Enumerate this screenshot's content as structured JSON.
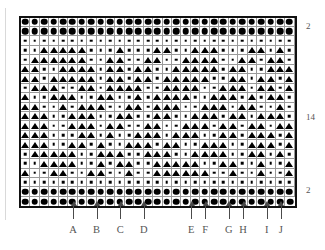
{
  "chart_data": {
    "type": "heatmap",
    "title": "",
    "xlabel": "",
    "ylabel": "",
    "columns": 29,
    "rows": 18,
    "symbol_legend": {
      "big": "large-filled-circle",
      "dot": "small-filled-dot",
      "tri": "filled-triangle",
      "empty": "blank-cell"
    },
    "row_groups": [
      {
        "label": "2",
        "count": 2,
        "type": "border-top"
      },
      {
        "label": "14",
        "count": 14,
        "type": "pattern"
      },
      {
        "label": "2",
        "count": 2,
        "type": "border-bottom"
      }
    ],
    "matrix": [
      [
        "big",
        "big",
        "big",
        "big",
        "big",
        "big",
        "big",
        "big",
        "big",
        "big",
        "big",
        "big",
        "big",
        "big",
        "big",
        "big",
        "big",
        "big",
        "big",
        "big",
        "big",
        "big",
        "big",
        "big",
        "big",
        "big",
        "big",
        "big",
        "big"
      ],
      [
        "big",
        "big",
        "big",
        "big",
        "big",
        "big",
        "big",
        "big",
        "big",
        "big",
        "big",
        "big",
        "big",
        "big",
        "big",
        "big",
        "big",
        "big",
        "big",
        "big",
        "big",
        "big",
        "big",
        "big",
        "big",
        "big",
        "big",
        "big",
        "big"
      ],
      [
        "dot",
        "dot",
        "dot",
        "dot",
        "dot",
        "dot",
        "dot",
        "dot",
        "dot",
        "dot",
        "dot",
        "dot",
        "dot",
        "dot",
        "dot",
        "dot",
        "dot",
        "dot",
        "dot",
        "dot",
        "dot",
        "dot",
        "dot",
        "dot",
        "dot",
        "dot",
        "dot",
        "dot",
        "dot"
      ],
      [
        "dot",
        "dot",
        "tri",
        "tri",
        "tri",
        "tri",
        "tri",
        "dot",
        "dot",
        "dot",
        "tri",
        "dot",
        "dot",
        "dot",
        "tri",
        "tri",
        "dot",
        "dot",
        "tri",
        "tri",
        "tri",
        "dot",
        "dot",
        "dot",
        "tri",
        "tri",
        "dot",
        "tri",
        "dot"
      ],
      [
        "dot",
        "tri",
        "tri",
        "tri",
        "tri",
        "tri",
        "tri",
        "dot",
        "dot",
        "tri",
        "tri",
        "dot",
        "dot",
        "tri",
        "tri",
        "dot",
        "dot",
        "tri",
        "tri",
        "tri",
        "tri",
        "dot",
        "dot",
        "tri",
        "tri",
        "dot",
        "tri",
        "tri",
        "dot"
      ],
      [
        "tri",
        "tri",
        "dot",
        "dot",
        "tri",
        "tri",
        "tri",
        "tri",
        "dot",
        "tri",
        "tri",
        "dot",
        "tri",
        "tri",
        "dot",
        "dot",
        "tri",
        "tri",
        "tri",
        "tri",
        "tri",
        "dot",
        "tri",
        "tri",
        "dot",
        "dot",
        "tri",
        "tri",
        "tri"
      ],
      [
        "tri",
        "tri",
        "dot",
        "tri",
        "tri",
        "tri",
        "tri",
        "tri",
        "dot",
        "tri",
        "tri",
        "dot",
        "tri",
        "tri",
        "dot",
        "tri",
        "tri",
        "tri",
        "tri",
        "tri",
        "dot",
        "dot",
        "tri",
        "tri",
        "dot",
        "tri",
        "tri",
        "dot",
        "tri"
      ],
      [
        "dot",
        "tri",
        "tri",
        "tri",
        "dot",
        "dot",
        "tri",
        "tri",
        "dot",
        "tri",
        "tri",
        "tri",
        "tri",
        "dot",
        "dot",
        "tri",
        "tri",
        "tri",
        "tri",
        "dot",
        "dot",
        "tri",
        "tri",
        "tri",
        "dot",
        "tri",
        "tri",
        "dot",
        "tri"
      ],
      [
        "tri",
        "dot",
        "dot",
        "tri",
        "tri",
        "tri",
        "dot",
        "dot",
        "tri",
        "tri",
        "dot",
        "dot",
        "tri",
        "dot",
        "tri",
        "tri",
        "tri",
        "tri",
        "dot",
        "dot",
        "tri",
        "tri",
        "tri",
        "dot",
        "tri",
        "dot",
        "tri",
        "tri",
        "dot"
      ],
      [
        "tri",
        "tri",
        "dot",
        "dot",
        "tri",
        "dot",
        "tri",
        "tri",
        "tri",
        "dot",
        "dot",
        "tri",
        "tri",
        "dot",
        "tri",
        "tri",
        "tri",
        "dot",
        "dot",
        "tri",
        "tri",
        "tri",
        "dot",
        "tri",
        "tri",
        "dot",
        "dot",
        "tri",
        "dot"
      ],
      [
        "tri",
        "tri",
        "tri",
        "dot",
        "dot",
        "tri",
        "tri",
        "tri",
        "dot",
        "dot",
        "tri",
        "tri",
        "dot",
        "dot",
        "tri",
        "tri",
        "dot",
        "dot",
        "tri",
        "tri",
        "tri",
        "dot",
        "tri",
        "tri",
        "dot",
        "tri",
        "tri",
        "tri",
        "dot"
      ],
      [
        "tri",
        "tri",
        "tri",
        "dot",
        "dot",
        "tri",
        "tri",
        "tri",
        "dot",
        "tri",
        "tri",
        "dot",
        "dot",
        "tri",
        "tri",
        "dot",
        "dot",
        "tri",
        "tri",
        "tri",
        "dot",
        "tri",
        "tri",
        "dot",
        "tri",
        "tri",
        "dot",
        "tri",
        "tri"
      ],
      [
        "tri",
        "tri",
        "tri",
        "dot",
        "dot",
        "dot",
        "tri",
        "tri",
        "dot",
        "tri",
        "dot",
        "dot",
        "tri",
        "tri",
        "tri",
        "dot",
        "tri",
        "tri",
        "tri",
        "dot",
        "dot",
        "tri",
        "tri",
        "dot",
        "tri",
        "tri",
        "tri",
        "dot",
        "tri"
      ],
      [
        "tri",
        "tri",
        "tri",
        "dot",
        "dot",
        "tri",
        "tri",
        "dot",
        "tri",
        "dot",
        "dot",
        "tri",
        "tri",
        "tri",
        "dot",
        "tri",
        "tri",
        "dot",
        "dot",
        "tri",
        "tri",
        "tri",
        "dot",
        "dot",
        "tri",
        "tri",
        "tri",
        "dot",
        "tri"
      ],
      [
        "dot",
        "tri",
        "tri",
        "tri",
        "tri",
        "tri",
        "dot",
        "dot",
        "tri",
        "tri",
        "tri",
        "dot",
        "dot",
        "tri",
        "tri",
        "tri",
        "dot",
        "dot",
        "tri",
        "tri",
        "tri",
        "tri",
        "dot",
        "dot",
        "tri",
        "tri",
        "dot",
        "tri",
        "dot"
      ],
      [
        "dot",
        "dot",
        "tri",
        "tri",
        "tri",
        "tri",
        "dot",
        "dot",
        "tri",
        "dot",
        "tri",
        "tri",
        "dot",
        "dot",
        "tri",
        "tri",
        "tri",
        "tri",
        "tri",
        "dot",
        "dot",
        "tri",
        "tri",
        "dot",
        "dot",
        "tri",
        "dot",
        "dot",
        "tri"
      ],
      [
        "tri",
        "dot",
        "dot",
        "tri",
        "tri",
        "dot",
        "dot",
        "tri",
        "tri",
        "dot",
        "dot",
        "tri",
        "dot",
        "dot",
        "tri",
        "tri",
        "tri",
        "tri",
        "tri",
        "tri",
        "dot",
        "dot",
        "tri",
        "dot",
        "dot",
        "tri",
        "dot",
        "dot",
        "tri"
      ],
      [
        "dot",
        "dot",
        "dot",
        "dot",
        "dot",
        "dot",
        "dot",
        "dot",
        "dot",
        "dot",
        "dot",
        "dot",
        "dot",
        "dot",
        "dot",
        "dot",
        "dot",
        "dot",
        "dot",
        "dot",
        "dot",
        "dot",
        "dot",
        "dot",
        "dot",
        "dot",
        "dot",
        "dot",
        "dot"
      ],
      [
        "big",
        "big",
        "big",
        "big",
        "big",
        "big",
        "big",
        "big",
        "big",
        "big",
        "big",
        "big",
        "big",
        "big",
        "big",
        "big",
        "big",
        "big",
        "big",
        "big",
        "big",
        "big",
        "big",
        "big",
        "big",
        "big",
        "big",
        "big",
        "big"
      ],
      [
        "big",
        "big",
        "big",
        "big",
        "big",
        "big",
        "big",
        "big",
        "big",
        "big",
        "big",
        "big",
        "big",
        "big",
        "big",
        "big",
        "big",
        "big",
        "big",
        "big",
        "big",
        "big",
        "big",
        "big",
        "big",
        "big",
        "big",
        "big",
        "big"
      ]
    ]
  },
  "right_labels": [
    {
      "text": "2",
      "top": 22
    },
    {
      "text": "14",
      "top": 113
    },
    {
      "text": "2",
      "top": 186
    }
  ],
  "column_markers": [
    {
      "label": "A",
      "column": 6
    },
    {
      "label": "B",
      "column": 8.5
    },
    {
      "label": "C",
      "column": 11
    },
    {
      "label": "D",
      "column": 13.5
    },
    {
      "label": "E",
      "column": 18.5
    },
    {
      "label": "F",
      "column": 20
    },
    {
      "label": "G",
      "column": 22.5
    },
    {
      "label": "H",
      "column": 24
    },
    {
      "label": "I",
      "column": 26.5
    },
    {
      "label": "J",
      "column": 28
    }
  ]
}
